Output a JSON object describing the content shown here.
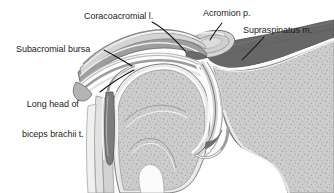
{
  "figure": {
    "width": 334,
    "height": 193,
    "background_color": "#ffffff"
  },
  "labels": {
    "coracoacromial_ligament": "Coracoacromial l.",
    "acromion_process": "Acromion p.",
    "supraspinatus_muscle": "Supraspinatus m.",
    "subacromial_bursa": "Subacromial bursa",
    "biceps_long_head_line1": "Long head of",
    "biceps_long_head_line2": "biceps brachii t."
  },
  "colors": {
    "outline": "#4a4a4a",
    "text": "#1c1c1c",
    "leader_line": "#111111",
    "bone_fill": "#c9c9c9",
    "bone_fill_light": "#d8d8d8",
    "bone_cortex": "#b0b0b0",
    "muscle_dark": "#6e6e6e",
    "muscle_mid": "#9a9a9a",
    "ligament_band": "#a8a8a8",
    "capsule_light": "#e4e4e4",
    "bursa_band": "#bdbdbd",
    "tendon_gray": "#8d8d8d",
    "highlight_white": "#f4f4f4",
    "stipple": "#8e8e8e"
  },
  "structures": [
    {
      "name": "acromion-process",
      "description": "Oval cross-section of acromion at upper right of arch"
    },
    {
      "name": "supraspinatus-muscle",
      "description": "Dark gray wedge-shaped muscle belly right of acromion"
    },
    {
      "name": "coracoacromial-ligament",
      "description": "Layered band spanning from coracoid toward acromion"
    },
    {
      "name": "subacromial-bursa",
      "description": "Thin band layers beneath the acromial arch"
    },
    {
      "name": "humeral-head",
      "description": "Large stippled bone head, center of figure"
    },
    {
      "name": "humeral-shaft",
      "description": "Bone shaft descending below humeral head"
    },
    {
      "name": "biceps-long-head-tendon",
      "description": "Tendon in intertubercular groove, left of humeral head"
    },
    {
      "name": "glenoid-and-capsule",
      "description": "Joint capsule bands curving around right of humeral head"
    },
    {
      "name": "scapula-body",
      "description": "Large stippled bone mass at right of figure"
    }
  ]
}
